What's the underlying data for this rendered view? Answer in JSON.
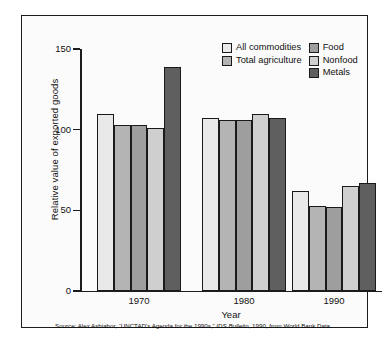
{
  "chart_data": {
    "type": "bar",
    "title": "",
    "xlabel": "Year",
    "ylabel": "Relative value of exported goods",
    "categories": [
      "1970",
      "1980",
      "1990"
    ],
    "ylim": [
      0,
      150
    ],
    "yticks": [
      0,
      50,
      100,
      150
    ],
    "ytick_labels": [
      "0",
      "50",
      "100",
      "150"
    ],
    "grid": false,
    "legend_position": "top-right",
    "series": [
      {
        "name": "All commodities",
        "color": "#e9e9e9",
        "values": [
          110,
          107,
          62
        ]
      },
      {
        "name": "Total agriculture",
        "color": "#b4b4b4",
        "values": [
          103,
          106,
          53
        ]
      },
      {
        "name": "Food",
        "color": "#9e9e9e",
        "values": [
          103,
          106,
          52
        ]
      },
      {
        "name": "Nonfood",
        "color": "#cfcfcf",
        "values": [
          101,
          110,
          65
        ]
      },
      {
        "name": "Metals",
        "color": "#5f5f5f",
        "values": [
          139,
          107,
          67
        ]
      }
    ],
    "annotations": {
      "source": "Source: Alex Ashiabor, ''UNCTAD's Agenda for the 1990s,'' IDS Bulletin, 1990, from World Bank Data.",
      "source_parts": {
        "before_italic": "Source: Alex Ashiabor, “UNCTAD's Agenda for the 1990s,” ",
        "italic": "IDS Bulletin",
        "after_italic": ", 1990, from World Bank Data."
      }
    }
  },
  "legend": {
    "entries": [
      {
        "label": "All commodities"
      },
      {
        "label": "Food"
      },
      {
        "label": "Total agriculture"
      },
      {
        "label": "Nonfood"
      },
      {
        "label": "Metals"
      }
    ]
  }
}
